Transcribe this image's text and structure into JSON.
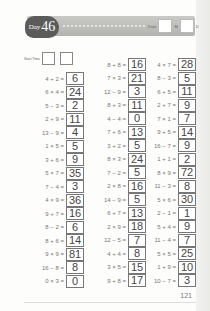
{
  "header": {
    "day_word": "Day",
    "day_number": "46",
    "date_label": "Date",
    "month_suffix": "M",
    "day_suffix": "D"
  },
  "start_time": {
    "label": "Start Time",
    "separator": ":"
  },
  "columns": [
    [
      {
        "q": "4 + 2 =",
        "a": "6"
      },
      {
        "q": "6 × 4 =",
        "a": "24"
      },
      {
        "q": "5 − 3 =",
        "a": "2"
      },
      {
        "q": "2 + 9 =",
        "a": "11"
      },
      {
        "q": "13 − 9 =",
        "a": "4"
      },
      {
        "q": "1 × 5 =",
        "a": "5"
      },
      {
        "q": "3 + 6 =",
        "a": "9"
      },
      {
        "q": "5 × 7 =",
        "a": "35"
      },
      {
        "q": "7 − 4 =",
        "a": "3"
      },
      {
        "q": "4 × 9 =",
        "a": "36"
      },
      {
        "q": "9 + 7 =",
        "a": "16"
      },
      {
        "q": "8 − 2 =",
        "a": "6"
      },
      {
        "q": "8 + 6 =",
        "a": "14"
      },
      {
        "q": "9 × 9 =",
        "a": "81"
      },
      {
        "q": "16 − 8 =",
        "a": "8"
      },
      {
        "q": "0 × 3 =",
        "a": "0"
      }
    ],
    [
      {
        "q": "8 + 8 =",
        "a": "16"
      },
      {
        "q": "7 × 3 =",
        "a": "21"
      },
      {
        "q": "12 − 9 =",
        "a": "3"
      },
      {
        "q": "8 + 3 =",
        "a": "11"
      },
      {
        "q": "4 − 4 =",
        "a": "0"
      },
      {
        "q": "7 + 6 =",
        "a": "13"
      },
      {
        "q": "3 + 2 =",
        "a": "5"
      },
      {
        "q": "8 × 3 =",
        "a": "24"
      },
      {
        "q": "7 − 2 =",
        "a": "5"
      },
      {
        "q": "2 × 8 =",
        "a": "16"
      },
      {
        "q": "14 − 9 =",
        "a": "5"
      },
      {
        "q": "6 + 7 =",
        "a": "13"
      },
      {
        "q": "2 × 9 =",
        "a": "18"
      },
      {
        "q": "12 − 5 =",
        "a": "7"
      },
      {
        "q": "4 + 4 =",
        "a": "8"
      },
      {
        "q": "3 × 5 =",
        "a": "15"
      },
      {
        "q": "9 + 8 =",
        "a": "17"
      }
    ],
    [
      {
        "q": "4 × 7 =",
        "a": "28"
      },
      {
        "q": "8 − 3 =",
        "a": "5"
      },
      {
        "q": "6 + 5 =",
        "a": "11"
      },
      {
        "q": "2 + 7 =",
        "a": "9"
      },
      {
        "q": "7 × 1 =",
        "a": "7"
      },
      {
        "q": "9 + 5 =",
        "a": "14"
      },
      {
        "q": "16 − 7 =",
        "a": "9"
      },
      {
        "q": "1 + 1 =",
        "a": "2"
      },
      {
        "q": "8 × 9 =",
        "a": "72"
      },
      {
        "q": "11 − 3 =",
        "a": "8"
      },
      {
        "q": "5 × 6 =",
        "a": "30"
      },
      {
        "q": "2 − 1 =",
        "a": "1"
      },
      {
        "q": "5 + 4 =",
        "a": "9"
      },
      {
        "q": "11 − 4 =",
        "a": "7"
      },
      {
        "q": "5 × 5 =",
        "a": "25"
      },
      {
        "q": "1 + 9 =",
        "a": "10"
      },
      {
        "q": "10 − 7 =",
        "a": "3"
      }
    ]
  ],
  "page_number": "121"
}
